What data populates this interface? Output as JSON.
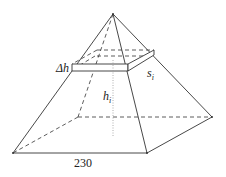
{
  "diagram": {
    "type": "pyramid-volume-slice",
    "labels": {
      "delta_h": "Δh",
      "s_i": "s",
      "s_i_sub": "i",
      "h_i": "h",
      "h_i_sub": "i",
      "base": "230"
    },
    "colors": {
      "line": "#333333",
      "dotted": "#999999",
      "background": "#ffffff"
    }
  }
}
